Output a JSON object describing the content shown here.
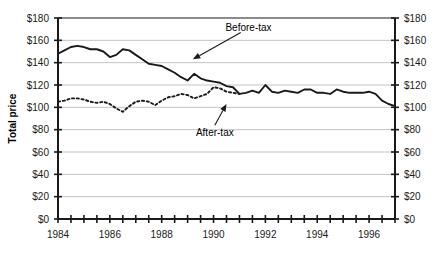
{
  "chart_data": {
    "type": "line",
    "title": "",
    "xlabel": "",
    "ylabel": "Total price",
    "xlim": [
      1984,
      1997
    ],
    "ylim": [
      0,
      180
    ],
    "grid": true,
    "grid_axis": "y",
    "legend": "none",
    "y_ticks": [
      0,
      20,
      40,
      60,
      80,
      100,
      120,
      140,
      160,
      180
    ],
    "y_tick_labels": [
      "$0",
      "$20",
      "$40",
      "$60",
      "$80",
      "$100",
      "$120",
      "$140",
      "$160",
      "$180"
    ],
    "y_axis_duplicated_right": true,
    "x_ticks": [
      1984,
      1984.5,
      1985,
      1985.5,
      1986,
      1986.5,
      1987,
      1987.5,
      1988,
      1988.5,
      1989,
      1989.5,
      1990,
      1990.5,
      1991,
      1991.5,
      1992,
      1992.5,
      1993,
      1993.5,
      1994,
      1994.5,
      1995,
      1995.5,
      1996,
      1996.5,
      1997
    ],
    "x_tick_labels": [
      "1984",
      "1986",
      "1988",
      "1990",
      "1992",
      "1994",
      "1996"
    ],
    "x_labeled_ticks": [
      1984,
      1986,
      1988,
      1990,
      1992,
      1994,
      1996
    ],
    "series": [
      {
        "name": "Before-tax",
        "style": "solid",
        "color": "#1a1a1a",
        "x": [
          1984.0,
          1984.25,
          1984.5,
          1984.75,
          1985.0,
          1985.25,
          1985.5,
          1985.75,
          1986.0,
          1986.25,
          1986.5,
          1986.75,
          1987.0,
          1987.25,
          1987.5,
          1987.75,
          1988.0,
          1988.25,
          1988.5,
          1988.75,
          1989.0,
          1989.25,
          1989.5,
          1989.75,
          1990.0,
          1990.25,
          1990.5,
          1990.75,
          1991.0,
          1991.25,
          1991.5,
          1991.75,
          1992.0,
          1992.25,
          1992.5,
          1992.75,
          1993.0,
          1993.25,
          1993.5,
          1993.75,
          1994.0,
          1994.25,
          1994.5,
          1994.75,
          1995.0,
          1995.25,
          1995.5,
          1995.75,
          1996.0,
          1996.25,
          1996.5,
          1996.75,
          1997.0
        ],
        "y": [
          148,
          151,
          154,
          155,
          154,
          152,
          152,
          150,
          145,
          147,
          152,
          151,
          147,
          143,
          139,
          138,
          137,
          134,
          131,
          127,
          124,
          130,
          126,
          124,
          123,
          122,
          119,
          118,
          112,
          113,
          115,
          113,
          120,
          114,
          113,
          115,
          114,
          113,
          116,
          116,
          113,
          113,
          112,
          116,
          114,
          113,
          113,
          113,
          114,
          112,
          106,
          103,
          101
        ]
      },
      {
        "name": "After-tax",
        "style": "dashed",
        "color": "#1a1a1a",
        "x": [
          1984.0,
          1984.25,
          1984.5,
          1984.75,
          1985.0,
          1985.25,
          1985.5,
          1985.75,
          1986.0,
          1986.25,
          1986.5,
          1986.75,
          1987.0,
          1987.25,
          1987.5,
          1987.75,
          1988.0,
          1988.25,
          1988.5,
          1988.75,
          1989.0,
          1989.25,
          1989.5,
          1989.75,
          1990.0,
          1990.25,
          1990.5,
          1990.75,
          1991.0
        ],
        "y": [
          105,
          106,
          108,
          108,
          107,
          105,
          104,
          105,
          103,
          99,
          96,
          101,
          105,
          106,
          105,
          102,
          106,
          109,
          110,
          112,
          111,
          108,
          110,
          112,
          118,
          117,
          114,
          113,
          112
        ]
      }
    ],
    "annotations": [
      {
        "text": "Before-tax",
        "label_x": 1991.35,
        "label_y": 172,
        "arrow_from_x": 1991.05,
        "arrow_from_y": 167,
        "arrow_to_x": 1989.2,
        "arrow_to_y": 143
      },
      {
        "text": "After-tax",
        "label_x": 1990.05,
        "label_y": 78,
        "arrow_from_x": 1990.05,
        "arrow_from_y": 84,
        "arrow_to_x": 1990.5,
        "arrow_to_y": 103
      }
    ]
  },
  "caption": {
    "partial_text": ""
  }
}
